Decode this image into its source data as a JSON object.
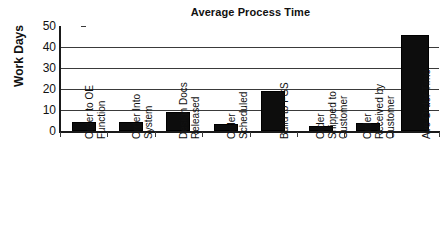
{
  "chart_data": {
    "type": "bar",
    "title": "Average Process Time",
    "xlabel": "",
    "ylabel": "Work Days",
    "ylim": [
      0,
      50
    ],
    "yticks": [
      0,
      10,
      20,
      30,
      40,
      50
    ],
    "grid": true,
    "legend": false,
    "categories": [
      "Order to OE Function",
      "Order Into System",
      "Design Docs Released",
      "Order Scheduled",
      "Build to FGS",
      "Order Shipped to Customer",
      "Order Received by Customer",
      "Ave Order Time"
    ],
    "category_lines": [
      [
        "Order to OE",
        "Function"
      ],
      [
        "Order Into",
        "System"
      ],
      [
        "Design Docs",
        "Released"
      ],
      [
        "Order",
        "Scheduled"
      ],
      [
        "Build to FGS"
      ],
      [
        "Order",
        "Shipped to",
        "Customer"
      ],
      [
        "Order",
        "Received by",
        "Customer"
      ],
      [
        "Ave Order Time"
      ]
    ],
    "values": [
      4.5,
      4.5,
      9,
      3.5,
      19,
      2.5,
      4,
      45.5
    ],
    "bar_color": "#0d0d0d",
    "axis_color": "#1a1a1a",
    "grid_color": "#3a3a3a",
    "background_color": "#ffffff"
  },
  "axis": {
    "y_tick_labels": [
      "50",
      "40",
      "30",
      "20",
      "10",
      "0"
    ]
  }
}
